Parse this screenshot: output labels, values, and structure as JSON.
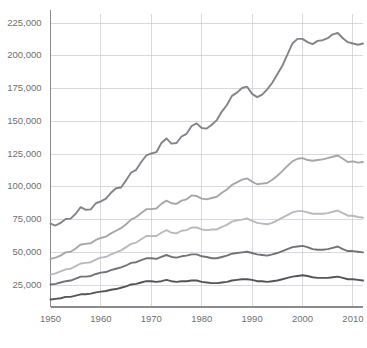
{
  "chart_data": {
    "type": "line",
    "title": "",
    "subtitle": "",
    "xlabel": "",
    "ylabel": "",
    "xlim": [
      1950,
      2012
    ],
    "ylim": [
      8300,
      232000
    ],
    "grid": true,
    "legend": "none",
    "y_ticks": [
      25000,
      50000,
      75000,
      100000,
      125000,
      150000,
      175000,
      200000,
      225000
    ],
    "y_tick_labels": [
      "25,000",
      "50,000",
      "75,000",
      "100,000",
      "125,000",
      "150,000",
      "175,000",
      "200,000",
      "225,000"
    ],
    "x_ticks": [
      1950,
      1960,
      1970,
      1980,
      1990,
      2000,
      2010
    ],
    "x_tick_labels": [
      "1950",
      "1960",
      "1970",
      "1980",
      "1990",
      "2000",
      "2010"
    ],
    "x": [
      1950,
      1951,
      1952,
      1953,
      1954,
      1955,
      1956,
      1957,
      1958,
      1959,
      1960,
      1961,
      1962,
      1963,
      1964,
      1965,
      1966,
      1967,
      1968,
      1969,
      1970,
      1971,
      1972,
      1973,
      1974,
      1975,
      1976,
      1977,
      1978,
      1979,
      1980,
      1981,
      1982,
      1983,
      1984,
      1985,
      1986,
      1987,
      1988,
      1989,
      1990,
      1991,
      1992,
      1993,
      1994,
      1995,
      1996,
      1997,
      1998,
      1999,
      2000,
      2001,
      2002,
      2003,
      2004,
      2005,
      2006,
      2007,
      2008,
      2009,
      2010,
      2011,
      2012
    ],
    "series": [
      {
        "name": "top-line",
        "color": "#83838b",
        "values": [
          72000,
          70500,
          72500,
          75500,
          75800,
          79500,
          84500,
          82500,
          82800,
          87500,
          89000,
          91000,
          95500,
          99000,
          99500,
          105000,
          111000,
          113000,
          119000,
          124000,
          125500,
          126500,
          133500,
          137000,
          133000,
          133500,
          138500,
          140500,
          146500,
          148500,
          145000,
          144500,
          147500,
          151000,
          157500,
          162500,
          169500,
          172000,
          175500,
          176500,
          171000,
          168500,
          170500,
          174500,
          179500,
          186000,
          192500,
          201000,
          209500,
          213000,
          213000,
          210500,
          209000,
          211500,
          212000,
          213500,
          216500,
          217500,
          213500,
          210500,
          209500,
          208500,
          209500
        ]
      },
      {
        "name": "second-line",
        "color": "#a6a6ad",
        "values": [
          45000,
          46000,
          47500,
          50000,
          50500,
          53000,
          56000,
          56500,
          57000,
          59500,
          61000,
          62000,
          64500,
          66500,
          68500,
          71500,
          75000,
          77000,
          80000,
          83000,
          83000,
          83500,
          87000,
          89500,
          87500,
          87000,
          89500,
          90500,
          93500,
          93000,
          91000,
          90500,
          91500,
          92500,
          95500,
          98000,
          101500,
          103500,
          105500,
          106500,
          104000,
          102000,
          102500,
          103000,
          105500,
          108500,
          112000,
          116000,
          119500,
          121500,
          122000,
          120500,
          120000,
          120500,
          121000,
          122000,
          123000,
          124000,
          121500,
          119000,
          119500,
          118500,
          119000
        ]
      },
      {
        "name": "third-line",
        "color": "#b9b9c0",
        "values": [
          33000,
          34000,
          35500,
          37000,
          37500,
          39500,
          41500,
          42000,
          42500,
          44500,
          46000,
          46500,
          48500,
          50000,
          51500,
          54000,
          56500,
          57500,
          60000,
          62500,
          62500,
          62500,
          65000,
          67000,
          65000,
          64500,
          66500,
          67000,
          69000,
          69000,
          67500,
          67000,
          67500,
          67500,
          69500,
          71000,
          73500,
          74500,
          75000,
          76000,
          74000,
          72500,
          72000,
          71500,
          72500,
          74500,
          76500,
          78500,
          80500,
          81500,
          81500,
          80500,
          79500,
          79500,
          79500,
          80000,
          81000,
          82000,
          80000,
          78000,
          78000,
          77000,
          76500
        ]
      },
      {
        "name": "fourth-line",
        "color": "#72727a",
        "values": [
          25500,
          26000,
          27000,
          28000,
          28500,
          30000,
          31500,
          31500,
          32000,
          33500,
          34500,
          35000,
          36500,
          37500,
          38500,
          40000,
          42000,
          42500,
          44000,
          45500,
          45500,
          45000,
          46500,
          48000,
          46500,
          46000,
          47000,
          47500,
          48500,
          48500,
          47000,
          46500,
          45500,
          45500,
          46500,
          47500,
          49000,
          49500,
          50000,
          50500,
          49500,
          48500,
          48000,
          47500,
          48500,
          49500,
          51000,
          52500,
          54000,
          54500,
          55000,
          54000,
          52500,
          52000,
          52000,
          52500,
          53500,
          54500,
          52500,
          51000,
          51000,
          50500,
          50000
        ]
      },
      {
        "name": "bottom-line",
        "color": "#54545c",
        "values": [
          14000,
          14500,
          15000,
          16000,
          16000,
          17000,
          18000,
          18000,
          18500,
          19500,
          20000,
          20500,
          21500,
          22000,
          23000,
          24000,
          25500,
          26000,
          27000,
          28000,
          28000,
          27500,
          28000,
          29000,
          28000,
          27500,
          28000,
          28000,
          28500,
          28500,
          27500,
          27000,
          26500,
          26500,
          27000,
          27500,
          28500,
          29000,
          29500,
          29500,
          29000,
          28000,
          28000,
          27500,
          28000,
          28500,
          29500,
          30500,
          31500,
          32000,
          32500,
          32000,
          31000,
          30500,
          30500,
          30500,
          31000,
          31500,
          30500,
          29500,
          29500,
          29000,
          28500
        ]
      }
    ]
  }
}
